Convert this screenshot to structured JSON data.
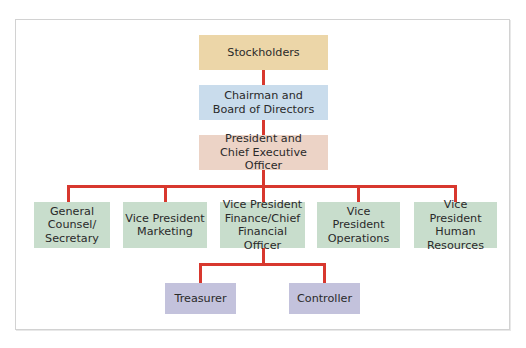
{
  "diagram": {
    "type": "organization-chart",
    "colors": {
      "connector": "#d8382e",
      "stockholders": "#ecd6a8",
      "board": "#c9dcec",
      "executive": "#ecd3c6",
      "vice_presidents": "#c8ddcc",
      "finance_staff": "#c3c2dc",
      "frame_border": "#d2d2d2"
    },
    "levels": {
      "top": {
        "label": "Stockholders"
      },
      "board": {
        "label": "Chairman and\nBoard of Directors"
      },
      "executive": {
        "label": "President and\nChief Executive Officer"
      },
      "officers": [
        {
          "label": "General\nCounsel/\nSecretary"
        },
        {
          "label": "Vice President\nMarketing"
        },
        {
          "label": "Vice President\nFinance/Chief\nFinancial Officer"
        },
        {
          "label": "Vice President\nOperations"
        },
        {
          "label": "Vice President\nHuman\nResources"
        }
      ],
      "finance_reports": [
        {
          "label": "Treasurer"
        },
        {
          "label": "Controller"
        }
      ]
    },
    "edges": [
      [
        "Stockholders",
        "Chairman and Board of Directors"
      ],
      [
        "Chairman and Board of Directors",
        "President and Chief Executive Officer"
      ],
      [
        "President and Chief Executive Officer",
        "General Counsel/Secretary"
      ],
      [
        "President and Chief Executive Officer",
        "Vice President Marketing"
      ],
      [
        "President and Chief Executive Officer",
        "Vice President Finance/Chief Financial Officer"
      ],
      [
        "President and Chief Executive Officer",
        "Vice President Operations"
      ],
      [
        "President and Chief Executive Officer",
        "Vice President Human Resources"
      ],
      [
        "Vice President Finance/Chief Financial Officer",
        "Treasurer"
      ],
      [
        "Vice President Finance/Chief Financial Officer",
        "Controller"
      ]
    ]
  }
}
